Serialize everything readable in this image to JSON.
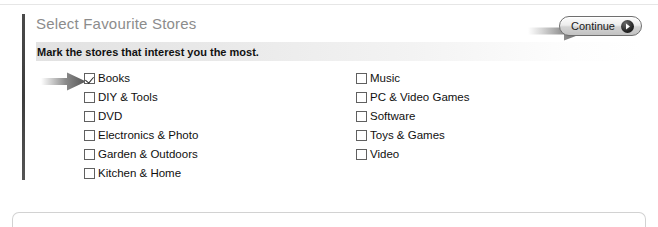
{
  "panel": {
    "title": "Select Favourite Stores",
    "subtitle": "Mark the stores that interest you the most.",
    "continue_button": {
      "label": "Continue",
      "icon": "chevron-right-circle-icon"
    },
    "annotations": {
      "continue_arrow": "arrow-pointing-to-continue-button",
      "books_arrow": "arrow-pointing-to-books-checkbox"
    }
  },
  "stores": {
    "left_column": [
      {
        "label": "Books",
        "checked": true
      },
      {
        "label": "DIY & Tools",
        "checked": false
      },
      {
        "label": "DVD",
        "checked": false
      },
      {
        "label": "Electronics & Photo",
        "checked": false
      },
      {
        "label": "Garden & Outdoors",
        "checked": false
      },
      {
        "label": "Kitchen & Home",
        "checked": false
      }
    ],
    "right_column": [
      {
        "label": "Music",
        "checked": false
      },
      {
        "label": "PC & Video Games",
        "checked": false
      },
      {
        "label": "Software",
        "checked": false
      },
      {
        "label": "Toys & Games",
        "checked": false
      },
      {
        "label": "Video",
        "checked": false
      }
    ]
  },
  "colors": {
    "title_grey": "#8c8c8c",
    "text_black": "#101010",
    "panel_rule": "#424242",
    "band_grey": "#e2e2e2",
    "arrow_grey": "#6b6b6b"
  }
}
